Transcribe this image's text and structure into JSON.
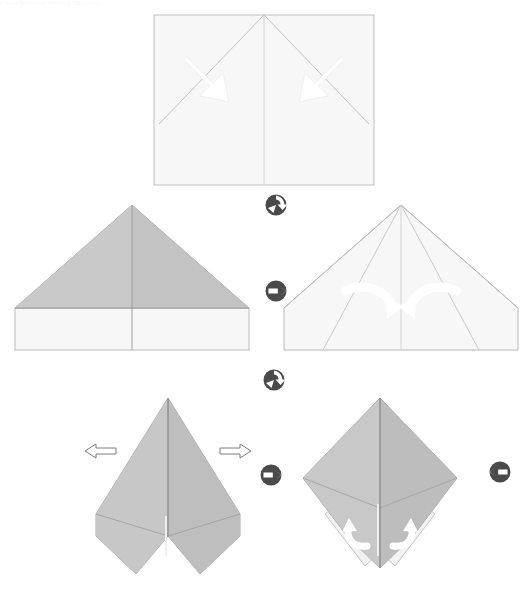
{
  "document": {
    "title": "Paper airplane folding instructions",
    "kind": "origami step diagram",
    "header_text": "Paper Airplane Folding Diagram",
    "background_color": "#ffffff",
    "step_count": 5
  },
  "palette": {
    "paper_front": "#f7f7f7",
    "paper_back": "#c6c6c6",
    "paper_back_light": "#cfcfcf",
    "paper_back_dark": "#bdbdbd",
    "edge_line": "#b3b3b3",
    "crease_line": "#c8c8c8",
    "arrow_fill": "#ffffff",
    "arrow_outline_stroke": "#8a8a8a",
    "icon_color": "#4a4a4a"
  },
  "steps": [
    {
      "id": "step-1",
      "index": 1,
      "name": "initial-sheet-with-creases",
      "caption": "Fold the two top corners down to the center crease",
      "shape": "rectangle",
      "face": "front",
      "arrow_kind": "straight-solid",
      "arrow_count": 2,
      "arrow_direction": "inward-down"
    },
    {
      "id": "step-2",
      "index": 2,
      "name": "corners-folded-triangle",
      "caption": "Both corners folded: triangle over remaining band",
      "shape": "triangle-on-rectangle",
      "face": "back",
      "arrow_kind": "none",
      "arrow_count": 0,
      "arrow_direction": "none"
    },
    {
      "id": "step-3",
      "index": 3,
      "name": "flipped-fold-sides-in",
      "caption": "Flip over and fold the slanted edges in to the center",
      "shape": "pentagon",
      "face": "front",
      "arrow_kind": "curved-solid",
      "arrow_count": 2,
      "arrow_direction": "inward-curl"
    },
    {
      "id": "step-4",
      "index": 4,
      "name": "narrow-dart-pull-out",
      "caption": "Pull the two inner flaps outward",
      "shape": "dart",
      "face": "back",
      "arrow_kind": "straight-outline",
      "arrow_count": 2,
      "arrow_direction": "outward-horizontal"
    },
    {
      "id": "step-5",
      "index": 5,
      "name": "diamond-with-wing-flaps",
      "caption": "Fold the lower wing flaps up",
      "shape": "diamond-with-flaps",
      "face": "back",
      "arrow_kind": "curved-solid",
      "arrow_count": 2,
      "arrow_direction": "upward-curl"
    }
  ],
  "rotation_icons": [
    {
      "id": "rotate-icon-1",
      "name": "rotate-icon",
      "between": "step-1-and-step-2",
      "glyph": "turn-over-circular",
      "direction": "clockwise"
    },
    {
      "id": "flip-icon-1",
      "name": "flip-horizontal-icon",
      "between": "step-2-and-step-3",
      "glyph": "flip-arrow-right",
      "direction": "right"
    },
    {
      "id": "rotate-icon-2",
      "name": "rotate-icon",
      "between": "step-3-and-step-4",
      "glyph": "turn-over-circular",
      "direction": "clockwise"
    },
    {
      "id": "flip-icon-2",
      "name": "flip-horizontal-icon",
      "between": "step-4-and-step-5",
      "glyph": "flip-arrow-right",
      "direction": "right"
    },
    {
      "id": "flip-icon-3",
      "name": "flip-horizontal-icon",
      "between": "step-5-and-next",
      "glyph": "flip-arrow-left",
      "direction": "left"
    }
  ]
}
